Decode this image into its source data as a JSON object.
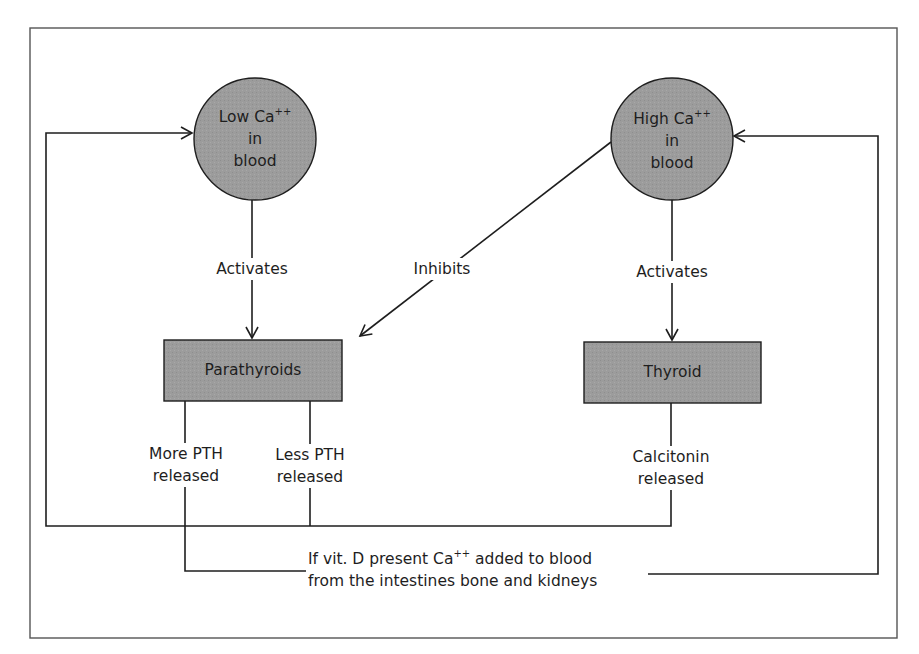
{
  "diagram": {
    "colors": {
      "node_fill": "#9a9a9a",
      "stroke": "#1e1e1e",
      "frame": "#555555",
      "background": "#ffffff"
    },
    "nodes": {
      "low_ca": {
        "line1": "Low Ca",
        "sup": "++",
        "line2": "in",
        "line3": "blood",
        "shape": "circle"
      },
      "high_ca": {
        "line1": "High Ca",
        "sup": "++",
        "line2": "in",
        "line3": "blood",
        "shape": "circle"
      },
      "parathyroids": {
        "label": "Parathyroids",
        "shape": "rectangle"
      },
      "thyroid": {
        "label": "Thyroid",
        "shape": "rectangle"
      }
    },
    "edge_labels": {
      "low_activates": "Activates",
      "high_activates": "Activates",
      "inhibits": "Inhibits",
      "more_pth_1": "More PTH",
      "more_pth_2": "released",
      "less_pth_1": "Less PTH",
      "less_pth_2": "released",
      "calcitonin_1": "Calcitonin",
      "calcitonin_2": "released",
      "vitd_1a": "If vit. D present Ca",
      "vitd_sup": "++",
      "vitd_1b": " added to blood",
      "vitd_2": "from the intestines bone and kidneys"
    },
    "edges": [
      {
        "from": "low_ca",
        "to": "parathyroids",
        "label": "Activates"
      },
      {
        "from": "high_ca",
        "to": "parathyroids",
        "label": "Inhibits"
      },
      {
        "from": "high_ca",
        "to": "thyroid",
        "label": "Activates"
      },
      {
        "from": "parathyroids",
        "to": "high_ca",
        "label": "More PTH released / If vit. D present Ca++ added to blood from the intestines bone and kidneys"
      },
      {
        "from": "parathyroids",
        "to": "low_ca",
        "label": "Less PTH released"
      },
      {
        "from": "thyroid",
        "to": "low_ca",
        "label": "Calcitonin released"
      }
    ]
  }
}
